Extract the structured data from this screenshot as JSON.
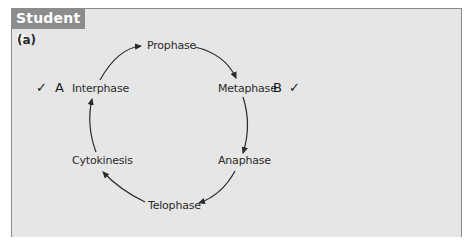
{
  "header": {
    "tab_label": "Student B",
    "part_label": "(a)"
  },
  "cycle": {
    "stages": [
      {
        "label": "Prophase"
      },
      {
        "label": "Metaphase"
      },
      {
        "label": "Anaphase"
      },
      {
        "label": "Telophase"
      },
      {
        "label": "Cytokinesis"
      },
      {
        "label": "Interphase"
      }
    ]
  },
  "marks": {
    "a": {
      "tick": "✓",
      "letter": "A"
    },
    "b": {
      "tick": "✓",
      "letter": "B"
    }
  },
  "colors": {
    "panel_bg": "#e6e6e6",
    "tab_bg": "#8c8c8c",
    "border": "#8a8a8a",
    "text": "#2a2a2a"
  }
}
